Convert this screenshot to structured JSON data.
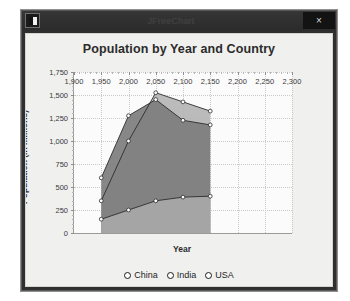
{
  "window": {
    "title": "JFreeChart",
    "app_icon": "application-icon",
    "close_label": "×",
    "close_icon": "close-icon"
  },
  "chart_data": {
    "type": "area",
    "title": "Population by Year and Country",
    "xlabel": "Year",
    "ylabel": "Population (in millions)",
    "x": [
      1950,
      2000,
      2050,
      2100,
      2150
    ],
    "xlim": [
      1900,
      2300
    ],
    "ylim": [
      0,
      1750
    ],
    "xticks": [
      "1,900",
      "1,950",
      "2,000",
      "2,050",
      "2,100",
      "2,150",
      "2,200",
      "2,250",
      "2,300"
    ],
    "xtick_values": [
      1900,
      1950,
      2000,
      2050,
      2100,
      2150,
      2200,
      2250,
      2300
    ],
    "yticks": [
      "0",
      "250",
      "500",
      "750",
      "1,000",
      "1,250",
      "1,500",
      "1,750"
    ],
    "ytick_values": [
      0,
      250,
      500,
      750,
      1000,
      1250,
      1500,
      1750
    ],
    "grid": true,
    "legend_position": "bottom",
    "series": [
      {
        "name": "China",
        "color": "#7d7d7d",
        "values": [
          600,
          1275,
          1450,
          1225,
          1175
        ]
      },
      {
        "name": "India",
        "color": "#b5b5b5",
        "values": [
          350,
          1000,
          1525,
          1425,
          1325
        ]
      },
      {
        "name": "USA",
        "color": "#a8a8a8",
        "values": [
          150,
          250,
          350,
          390,
          400
        ]
      }
    ]
  },
  "legend": {
    "items": [
      {
        "label": "China",
        "marker": "circle-marker"
      },
      {
        "label": "India",
        "marker": "circle-marker"
      },
      {
        "label": "USA",
        "marker": "circle-marker"
      }
    ]
  }
}
